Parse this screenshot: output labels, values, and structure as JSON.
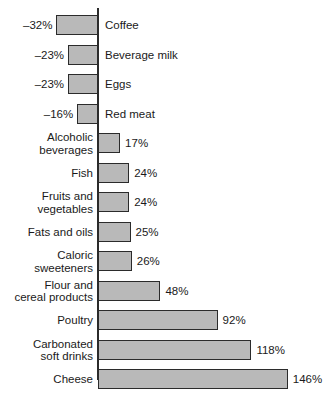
{
  "chart_data": {
    "type": "bar",
    "orientation": "horizontal",
    "title": "",
    "subtitle": "",
    "xlabel": "",
    "ylabel": "",
    "grid": false,
    "legend": null,
    "zero_axis": true,
    "value_suffix": "%",
    "xlim": [
      -32,
      146
    ],
    "categories": [
      "Coffee",
      "Beverage milk",
      "Eggs",
      "Red meat",
      "Alcoholic\nbeverages",
      "Fish",
      "Fruits and\nvegetables",
      "Fats and oils",
      "Caloric\nsweeteners",
      "Flour and\ncereal products",
      "Poultry",
      "Carbonated\nsoft drinks",
      "Cheese"
    ],
    "values": [
      -32,
      -23,
      -23,
      -16,
      17,
      24,
      24,
      25,
      26,
      48,
      92,
      118,
      146
    ],
    "value_labels": [
      "–32%",
      "–23%",
      "–23%",
      "–16%",
      "17%",
      "24%",
      "24%",
      "25%",
      "26%",
      "48%",
      "92%",
      "118%",
      "146%"
    ],
    "colors": {
      "bar_fill": "#b9b9b9",
      "bar_stroke": "#2b2b2b",
      "axis": "#2b2b2b",
      "text": "#1a1a1a",
      "background": "#ffffff"
    }
  }
}
